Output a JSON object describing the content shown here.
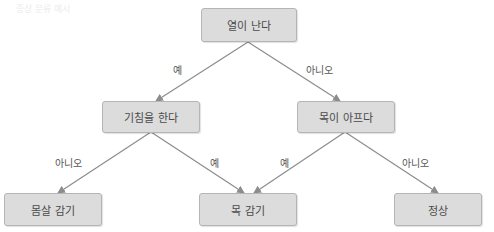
{
  "header": {
    "faded_text": "증상 분류 예시"
  },
  "nodes": {
    "root": {
      "label": "열이 난다"
    },
    "left": {
      "label": "기침을 한다"
    },
    "right": {
      "label": "목이 아프다"
    },
    "leaf_body": {
      "label": "몸살 감기"
    },
    "leaf_throat": {
      "label": "목 감기"
    },
    "leaf_normal": {
      "label": "정상"
    }
  },
  "edges": {
    "root_left": {
      "label": "예"
    },
    "root_right": {
      "label": "아니오"
    },
    "left_body": {
      "label": "아니오"
    },
    "left_throat": {
      "label": "예"
    },
    "right_throat": {
      "label": "예"
    },
    "right_normal": {
      "label": "아니오"
    }
  },
  "colors": {
    "node_fill": "#dcdcdc",
    "node_border": "#b5b5b5",
    "edge": "#8c8c8c",
    "text": "#4a4a4a"
  }
}
